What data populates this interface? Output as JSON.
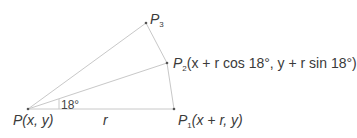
{
  "diagram": {
    "points": {
      "P": {
        "name": "P",
        "coords": "(x, y)",
        "x": 28,
        "y": 109
      },
      "P1": {
        "name": "P",
        "sub": "1",
        "coords": "(x + r, y)",
        "x": 174,
        "y": 109
      },
      "P2": {
        "name": "P",
        "sub": "2",
        "coords": "(x + r cos 18°, y + r sin 18°)",
        "x": 167,
        "y": 63
      },
      "P3": {
        "name": "P",
        "sub": "3",
        "coords": "",
        "x": 146,
        "y": 23
      }
    },
    "radius_label": "r",
    "angle_label": "18°",
    "colors": {
      "line": "#c8c8c8",
      "text": "#3a3a3a"
    }
  }
}
